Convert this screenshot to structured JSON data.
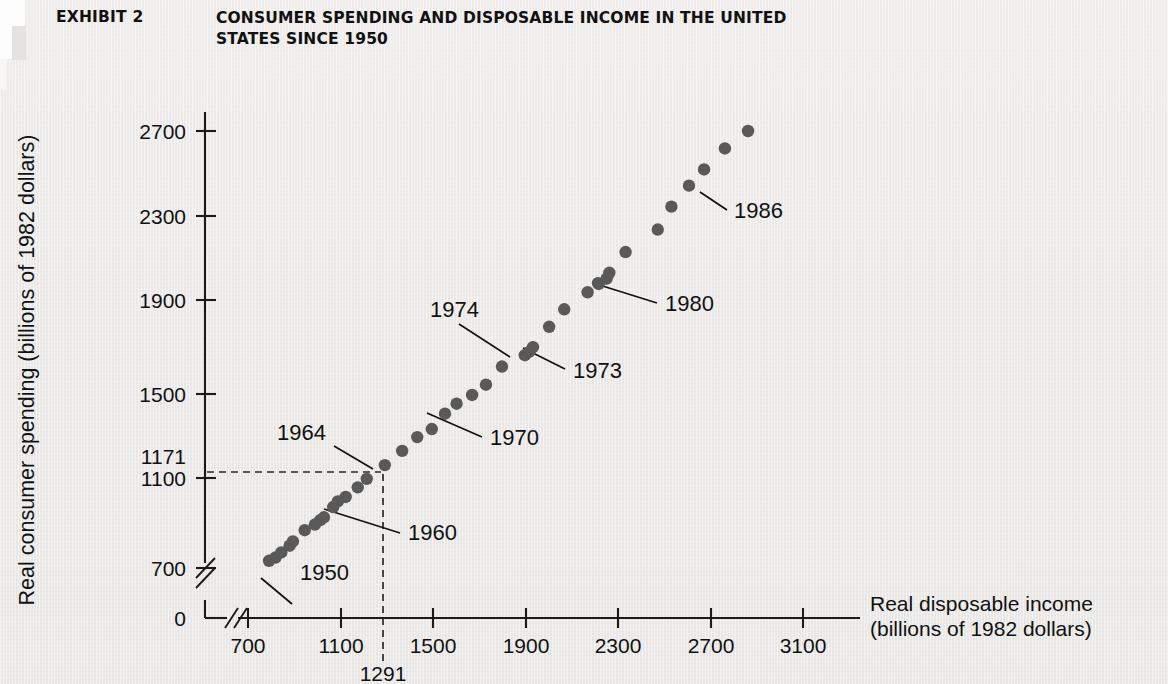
{
  "header": {
    "exhibit_label": "EXHIBIT 2",
    "title_line1": "CONSUMER SPENDING AND DISPOSABLE INCOME IN THE UNITED",
    "title_line2": "STATES SINCE 1950"
  },
  "colors": {
    "background": "#ecebe9",
    "ink": "#111111",
    "dot": "#595959",
    "dashed_guide": "#2a2a2a"
  },
  "chart_data": {
    "type": "scatter",
    "title": "CONSUMER SPENDING AND DISPOSABLE INCOME IN THE UNITED STATES SINCE 1950",
    "xlabel_line1": "Real disposable income",
    "xlabel_line2": "(billions of 1982 dollars)",
    "ylabel": "Real consumer spending (billions of 1982 dollars)",
    "xlim": [
      620,
      3250
    ],
    "ylim": [
      640,
      2820
    ],
    "x_ticks": [
      "700",
      "1100",
      "1500",
      "1900",
      "2300",
      "2700",
      "3100"
    ],
    "x_tick_values": [
      700,
      1100,
      1500,
      1900,
      2300,
      2700,
      3100
    ],
    "y_ticks": [
      "700",
      "1100",
      "1500",
      "1900",
      "2300",
      "2700"
    ],
    "y_tick_values": [
      700,
      1100,
      1500,
      1900,
      2300,
      2700
    ],
    "y_origin_label": "0",
    "axis_break": true,
    "grid": false,
    "legend": "none",
    "highlight": {
      "x_value": 1291,
      "y_value": 1171,
      "x_label": "1291",
      "y_label": "1171",
      "note": "dashed guide lines from the 1964 observation to both axes"
    },
    "series": [
      {
        "name": "Consumption vs. disposable income, 1950-1986",
        "points": [
          {
            "year": 1950,
            "x": 791,
            "y": 733
          },
          {
            "year": 1951,
            "x": 819,
            "y": 748
          },
          {
            "year": 1952,
            "x": 844,
            "y": 771
          },
          {
            "year": 1953,
            "x": 880,
            "y": 802
          },
          {
            "year": 1954,
            "x": 894,
            "y": 822
          },
          {
            "year": 1955,
            "x": 945,
            "y": 873
          },
          {
            "year": 1956,
            "x": 989,
            "y": 899
          },
          {
            "year": 1957,
            "x": 1012,
            "y": 919
          },
          {
            "year": 1958,
            "x": 1028,
            "y": 932
          },
          {
            "year": 1959,
            "x": 1068,
            "y": 979
          },
          {
            "year": 1960,
            "x": 1088,
            "y": 1005
          },
          {
            "year": 1961,
            "x": 1122,
            "y": 1025
          },
          {
            "year": 1962,
            "x": 1174,
            "y": 1069
          },
          {
            "year": 1963,
            "x": 1213,
            "y": 1108
          },
          {
            "year": 1964,
            "x": 1291,
            "y": 1171
          },
          {
            "year": 1965,
            "x": 1366,
            "y": 1236
          },
          {
            "year": 1966,
            "x": 1431,
            "y": 1299
          },
          {
            "year": 1967,
            "x": 1494,
            "y": 1336
          },
          {
            "year": 1968,
            "x": 1551,
            "y": 1406
          },
          {
            "year": 1969,
            "x": 1601,
            "y": 1452
          },
          {
            "year": 1970,
            "x": 1668,
            "y": 1492
          },
          {
            "year": 1971,
            "x": 1728,
            "y": 1539
          },
          {
            "year": 1972,
            "x": 1797,
            "y": 1622
          },
          {
            "year": 1973,
            "x": 1916,
            "y": 1690
          },
          {
            "year": 1974,
            "x": 1896,
            "y": 1674
          },
          {
            "year": 1975,
            "x": 1931,
            "y": 1711
          },
          {
            "year": 1976,
            "x": 2001,
            "y": 1804
          },
          {
            "year": 1977,
            "x": 2066,
            "y": 1884
          },
          {
            "year": 1978,
            "x": 2167,
            "y": 1962
          },
          {
            "year": 1979,
            "x": 2212,
            "y": 2004
          },
          {
            "year": 1980,
            "x": 2215,
            "y": 2000
          },
          {
            "year": 1981,
            "x": 2249,
            "y": 2024
          },
          {
            "year": 1982,
            "x": 2261,
            "y": 2051
          },
          {
            "year": 1983,
            "x": 2331,
            "y": 2146
          },
          {
            "year": 1984,
            "x": 2470,
            "y": 2249
          },
          {
            "year": 1985,
            "x": 2529,
            "y": 2354
          },
          {
            "year": 1986,
            "x": 2605,
            "y": 2450
          },
          {
            "year": 1987,
            "x": 2670,
            "y": 2524
          },
          {
            "year": 1988,
            "x": 2760,
            "y": 2620
          },
          {
            "year": 1989,
            "x": 2860,
            "y": 2700
          }
        ]
      }
    ],
    "annotations": [
      {
        "label": "1950",
        "points_to_year": 1950
      },
      {
        "label": "1960",
        "points_to_year": 1960
      },
      {
        "label": "1964",
        "points_to_year": 1964
      },
      {
        "label": "1970",
        "points_to_year": 1970
      },
      {
        "label": "1973",
        "points_to_year": 1973
      },
      {
        "label": "1974",
        "points_to_year": 1974
      },
      {
        "label": "1980",
        "points_to_year": 1980
      },
      {
        "label": "1986",
        "points_to_year": 1986
      }
    ]
  }
}
